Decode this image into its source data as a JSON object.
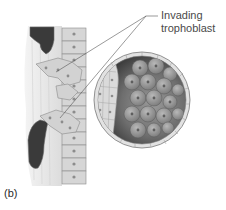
{
  "figure": {
    "panel_label": "(b)",
    "callouts": [
      {
        "line1": "Invading",
        "line2": "trophoblast"
      }
    ],
    "colors": {
      "tissue_background": "#e6e6e6",
      "cell_fill": "#d2d2d2",
      "cell_outline": "#8a8a8a",
      "nucleus": "#8c8c8c",
      "inner_cell_mass_dark": "#4d4d4d",
      "inner_cell_light": "#a0a0a0",
      "blood_vessel": "#3a3a3a",
      "leader_line": "#555555",
      "text": "#4a4a4a"
    }
  }
}
